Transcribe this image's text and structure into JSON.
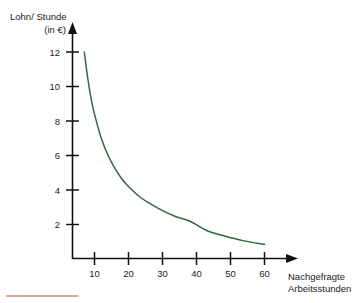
{
  "chart_data": {
    "type": "line",
    "title": "",
    "subtitle": "",
    "xlabel": "Nachgefragte Arbeitsstunden",
    "ylabel": "Lohn/ Stunde (in €)",
    "ylabel_line1": "Lohn/ Stunde",
    "ylabel_line2": "(in €)",
    "xlim": [
      0,
      66
    ],
    "ylim": [
      0,
      13
    ],
    "grid": false,
    "legend": "none",
    "series": [
      {
        "name": "Nachfrage nach Arbeitsstunden",
        "color": "#2d6b3d",
        "x": [
          7,
          8,
          9,
          10,
          12,
          14,
          16,
          18,
          20,
          23,
          26,
          30,
          34,
          38,
          43,
          48,
          54,
          60
        ],
        "y": [
          12.0,
          10.5,
          9.3,
          8.4,
          7.0,
          6.0,
          5.25,
          4.65,
          4.2,
          3.65,
          3.25,
          2.8,
          2.45,
          2.2,
          1.65,
          1.35,
          1.05,
          0.85
        ]
      }
    ],
    "x_ticks": [
      10,
      20,
      30,
      40,
      50,
      60
    ],
    "x_tick_labels": [
      "10",
      "20",
      "30",
      "40",
      "50",
      "60"
    ],
    "y_ticks": [
      2,
      4,
      6,
      8,
      10,
      12
    ],
    "y_tick_labels": [
      "2",
      "4",
      "6",
      "8",
      "10",
      "12"
    ],
    "annotations": []
  },
  "axes": {
    "y_title_line1": "Lohn/ Stunde",
    "y_title_line2": "(in €)",
    "x_title_line1": "Nachgefragte",
    "x_title_line2": "Arbeitsstunden"
  },
  "colors": {
    "curve": "#2d6b3d",
    "axis": "#111111",
    "text": "#1a1a1a",
    "footer_rule": "#c4887a",
    "background": "#ffffff"
  },
  "footer": {
    "rule_present": true
  }
}
